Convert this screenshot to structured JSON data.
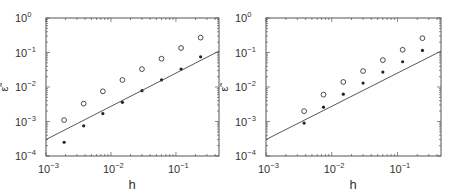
{
  "chart_data": [
    {
      "type": "scatter",
      "title": "",
      "xlabel": "h",
      "ylabel": "ε̃",
      "xscale": "log",
      "yscale": "log",
      "xlim": [
        0.001,
        0.46
      ],
      "ylim": [
        0.0001,
        1
      ],
      "grid": false,
      "legend": null,
      "x_ticks": [
        "10^-3",
        "10^-2",
        "10^-1"
      ],
      "y_ticks": [
        "10^-4",
        "10^-3",
        "10^-2",
        "10^-1",
        "10^0"
      ],
      "series": [
        {
          "name": "open circles",
          "marker": "circle-open",
          "x": [
            0.0019,
            0.0038,
            0.0075,
            0.015,
            0.03,
            0.06,
            0.12,
            0.24
          ],
          "y": [
            0.0011,
            0.0033,
            0.0075,
            0.016,
            0.033,
            0.066,
            0.135,
            0.27
          ]
        },
        {
          "name": "filled dots",
          "marker": "dot",
          "x": [
            0.0019,
            0.0038,
            0.0075,
            0.015,
            0.03,
            0.06,
            0.12,
            0.24
          ],
          "y": [
            0.00025,
            0.00075,
            0.0017,
            0.0036,
            0.0078,
            0.016,
            0.033,
            0.075
          ]
        },
        {
          "name": "reference line",
          "marker": "line",
          "x": [
            0.001,
            0.46
          ],
          "y": [
            0.0003,
            0.11
          ]
        }
      ]
    },
    {
      "type": "scatter",
      "title": "",
      "xlabel": "h",
      "ylabel": "ε̃",
      "xscale": "log",
      "yscale": "log",
      "xlim": [
        0.001,
        0.46
      ],
      "ylim": [
        0.0001,
        1
      ],
      "grid": false,
      "legend": null,
      "x_ticks": [
        "10^-3",
        "10^-2",
        "10^-1"
      ],
      "y_ticks": [
        "10^-4",
        "10^-3",
        "10^-2",
        "10^-1",
        "10^0"
      ],
      "series": [
        {
          "name": "open circles",
          "marker": "circle-open",
          "x": [
            0.0038,
            0.0075,
            0.015,
            0.03,
            0.06,
            0.12,
            0.24
          ],
          "y": [
            0.002,
            0.006,
            0.014,
            0.029,
            0.06,
            0.12,
            0.26
          ]
        },
        {
          "name": "filled dots",
          "marker": "dot",
          "x": [
            0.0038,
            0.0075,
            0.015,
            0.03,
            0.06,
            0.12,
            0.24
          ],
          "y": [
            0.0009,
            0.0026,
            0.0062,
            0.013,
            0.027,
            0.054,
            0.115
          ]
        },
        {
          "name": "reference line",
          "marker": "line",
          "x": [
            0.001,
            0.46
          ],
          "y": [
            0.0003,
            0.11
          ]
        }
      ]
    }
  ],
  "labels": {
    "xlabel": "h",
    "ylabel": "ε̃",
    "xtick_base": "10",
    "xtick_exps": [
      "−3",
      "−2",
      "−1"
    ],
    "ytick_exps": [
      "0",
      "−1",
      "−2",
      "−3",
      "−4"
    ]
  },
  "colors": {
    "axis": "#555555",
    "marker": "#222222",
    "line": "#444444"
  }
}
